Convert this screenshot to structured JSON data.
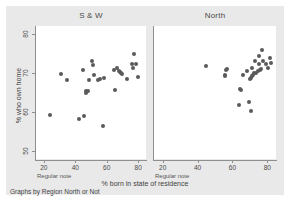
{
  "figure": {
    "x_title": "% born in state of residence",
    "y_title": "% who own home",
    "caption": "Graphs by Region North or Not",
    "panel_note": "Regular note",
    "dot_color": "#5a5a5a",
    "panel_bg": "#ffffff",
    "figure_bg": "#e9e9e9"
  },
  "chart_data": {
    "type": "scatter",
    "title": "",
    "xlabel": "% born in state of residence",
    "ylabel": "% who own home",
    "xlim": [
      15,
      85
    ],
    "ylim": [
      48,
      82
    ],
    "xticks": [
      20,
      40,
      60,
      80
    ],
    "yticks": [
      50,
      60,
      70,
      80
    ],
    "grid": false,
    "legend": null,
    "panels": [
      {
        "label": "S & W",
        "note": "Regular note",
        "points": [
          [
            24.0,
            59.3
          ],
          [
            31.0,
            69.7
          ],
          [
            35.0,
            68.2
          ],
          [
            42.5,
            58.2
          ],
          [
            45.5,
            59.0
          ],
          [
            45.0,
            70.7
          ],
          [
            46.5,
            65.3
          ],
          [
            47.0,
            65.0
          ],
          [
            48.0,
            65.5
          ],
          [
            48.5,
            68.3
          ],
          [
            50.5,
            73.0
          ],
          [
            51.0,
            72.0
          ],
          [
            52.0,
            69.4
          ],
          [
            54.5,
            68.3
          ],
          [
            55.5,
            68.5
          ],
          [
            57.5,
            56.5
          ],
          [
            58.5,
            68.6
          ],
          [
            64.5,
            70.8
          ],
          [
            65.5,
            65.6
          ],
          [
            66.5,
            71.3
          ],
          [
            68.0,
            70.5
          ],
          [
            68.5,
            70.3
          ],
          [
            69.0,
            70.0
          ],
          [
            70.0,
            69.8
          ],
          [
            73.0,
            68.5
          ],
          [
            76.0,
            72.3
          ],
          [
            77.0,
            71.3
          ],
          [
            77.5,
            74.8
          ],
          [
            78.5,
            72.3
          ],
          [
            80.0,
            68.9
          ]
        ]
      },
      {
        "label": "North",
        "note": "Regular note",
        "points": [
          [
            45.0,
            71.7
          ],
          [
            55.5,
            69.6
          ],
          [
            56.0,
            69.3
          ],
          [
            56.5,
            70.8
          ],
          [
            57.0,
            71.0
          ],
          [
            63.5,
            61.8
          ],
          [
            64.5,
            66.0
          ],
          [
            65.0,
            65.6
          ],
          [
            66.0,
            69.4
          ],
          [
            68.5,
            70.5
          ],
          [
            69.5,
            62.5
          ],
          [
            70.0,
            68.5
          ],
          [
            70.5,
            68.8
          ],
          [
            70.5,
            60.3
          ],
          [
            71.0,
            71.3
          ],
          [
            71.5,
            69.3
          ],
          [
            72.0,
            69.6
          ],
          [
            72.5,
            70.0
          ],
          [
            73.0,
            73.0
          ],
          [
            73.5,
            70.0
          ],
          [
            74.5,
            70.4
          ],
          [
            75.0,
            72.2
          ],
          [
            75.5,
            74.3
          ],
          [
            76.0,
            70.8
          ],
          [
            76.5,
            71.0
          ],
          [
            77.0,
            75.8
          ],
          [
            77.5,
            73.0
          ],
          [
            79.0,
            72.4
          ],
          [
            80.5,
            71.3
          ],
          [
            81.5,
            73.9
          ],
          [
            82.0,
            72.6
          ]
        ]
      }
    ]
  }
}
